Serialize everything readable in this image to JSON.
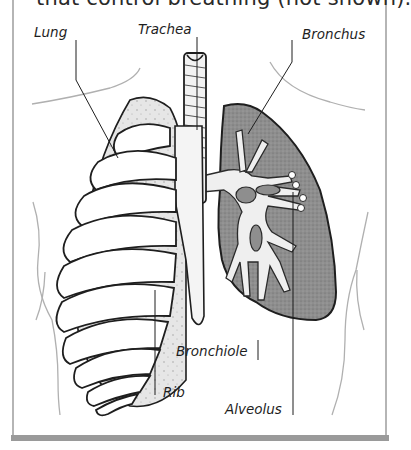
{
  "figure": {
    "caption_fragment": "that control breathing (not shown).",
    "labels": {
      "lung": "Lung",
      "trachea": "Trachea",
      "bronchus": "Bronchus",
      "bronchiole": "Bronchiole",
      "rib": "Rib",
      "alveolus": "Alveolus"
    },
    "colors": {
      "frame_border": "#b5b5b5",
      "bottom_bar": "#9a9a9a",
      "lung_fill": "#8e8e8e",
      "airway_fill": "#efefef",
      "outline": "#1e1e1e",
      "body_outline": "#b0b0b0"
    }
  }
}
